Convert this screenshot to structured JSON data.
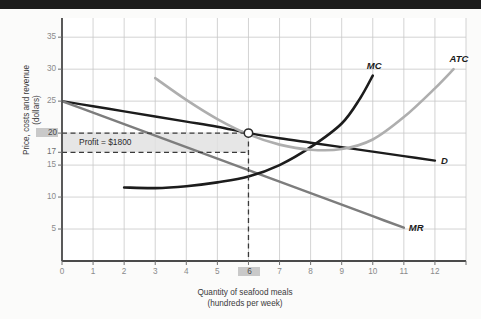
{
  "chart_data": {
    "type": "line",
    "title": "",
    "xlabel": "Quantity of seafood meals (hundreds per week)",
    "xlabel_line1": "Quantity of seafood meals",
    "xlabel_line2": "(hundreds per week)",
    "ylabel": "Price, costs and revenue (dollars)",
    "ylabel_line1": "Price, costs and revenue",
    "ylabel_line2": "(dollars)",
    "xlim": [
      0,
      13
    ],
    "ylim": [
      0,
      38
    ],
    "grid": true,
    "legend_position": "inline-curve-labels",
    "xticks": [
      0,
      1,
      2,
      3,
      4,
      5,
      6,
      7,
      8,
      9,
      10,
      11,
      12
    ],
    "xtick_labels": [
      "0",
      "1",
      "2",
      "3",
      "4",
      "5",
      "6",
      "7",
      "8",
      "9",
      "10",
      "11",
      "12"
    ],
    "yticks": [
      5,
      10,
      15,
      17,
      20,
      25,
      30,
      35
    ],
    "ytick_labels": [
      "5",
      "10",
      "15",
      "17",
      "20",
      "25",
      "30",
      "35"
    ],
    "highlighted_xtick": "6",
    "highlighted_ytick": "20",
    "series": [
      {
        "name": "D",
        "label": "D",
        "color": "#1c1c1c",
        "style": "solid",
        "points": [
          [
            0,
            25.0
          ],
          [
            1,
            24.2
          ],
          [
            2,
            23.4
          ],
          [
            3,
            22.6
          ],
          [
            4,
            21.8
          ],
          [
            5,
            21.0
          ],
          [
            6,
            20.0
          ],
          [
            7,
            19.2
          ],
          [
            8,
            18.5
          ],
          [
            9,
            17.8
          ],
          [
            10,
            17.1
          ],
          [
            11,
            16.4
          ],
          [
            12,
            15.7
          ]
        ]
      },
      {
        "name": "MR",
        "label": "MR",
        "color": "#7d7d7d",
        "style": "solid",
        "points": [
          [
            0,
            25.0
          ],
          [
            1,
            23.2
          ],
          [
            2,
            21.4
          ],
          [
            3,
            19.6
          ],
          [
            4,
            17.8
          ],
          [
            5,
            16.0
          ],
          [
            6,
            14.2
          ],
          [
            7,
            12.4
          ],
          [
            8,
            10.6
          ],
          [
            9,
            8.8
          ],
          [
            10,
            7.0
          ],
          [
            11,
            5.2
          ]
        ]
      },
      {
        "name": "MC",
        "label": "MC",
        "color": "#1c1c1c",
        "style": "solid",
        "points": [
          [
            2,
            11.5
          ],
          [
            3,
            11.4
          ],
          [
            4,
            11.7
          ],
          [
            5,
            12.3
          ],
          [
            6,
            13.2
          ],
          [
            7,
            15.0
          ],
          [
            8,
            17.8
          ],
          [
            9,
            21.5
          ],
          [
            9.6,
            25.5
          ],
          [
            10,
            29.0
          ]
        ]
      },
      {
        "name": "ATC",
        "label": "ATC",
        "color": "#aeaeae",
        "style": "solid",
        "points": [
          [
            3,
            28.6
          ],
          [
            4,
            25.2
          ],
          [
            5,
            22.2
          ],
          [
            6,
            19.8
          ],
          [
            7,
            18.2
          ],
          [
            8,
            17.4
          ],
          [
            9,
            17.5
          ],
          [
            10,
            19.0
          ],
          [
            11,
            22.5
          ],
          [
            12,
            27.0
          ],
          [
            12.6,
            30.0
          ]
        ]
      }
    ],
    "annotations": [
      {
        "name": "profit-rectangle",
        "text": "Profit = $1800",
        "x_range": [
          0,
          6
        ],
        "y_range": [
          17,
          20
        ],
        "fill": "#e2e2e2",
        "border": "dashed"
      },
      {
        "name": "equilibrium-point",
        "marker": "open-circle",
        "x": 6,
        "y": 20
      },
      {
        "name": "quantity-dropline",
        "style": "dashed",
        "x": 6,
        "y_range": [
          0,
          20
        ]
      }
    ]
  },
  "labels": {
    "profit_text": "Profit = $1800",
    "curve_d": "D",
    "curve_mr": "MR",
    "curve_mc": "MC",
    "curve_atc": "ATC"
  },
  "colors": {
    "axis": "#4a4a4a",
    "grid": "#c8c8c8",
    "dark_curve": "#1c1c1c",
    "mid_curve": "#7d7d7d",
    "light_curve": "#aeaeae",
    "profit_fill": "#e2e2e2",
    "highlight_box": "#c9c9c9",
    "background": "#fbfbfa",
    "top_band": "#1c1c1c"
  }
}
